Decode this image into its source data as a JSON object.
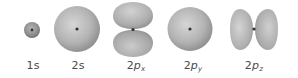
{
  "figure": {
    "title": "",
    "orbitals": [
      {
        "id": "1s",
        "label_prefix": "1",
        "label_symbol": "s",
        "label_subscript": "",
        "shape": "sphere",
        "center_x": 32,
        "center_y": 30
      },
      {
        "id": "2s",
        "label_prefix": "2",
        "label_symbol": "s",
        "label_subscript": "",
        "shape": "sphere",
        "center_x": 77,
        "center_y": 29
      },
      {
        "id": "2px",
        "label_prefix": "2",
        "label_symbol": "p",
        "label_subscript": "x",
        "shape": "dumbbell-vertical",
        "center_x": 133,
        "center_y": 29
      },
      {
        "id": "2py",
        "label_prefix": "2",
        "label_symbol": "p",
        "label_subscript": "y",
        "shape": "dumbbell-end-on",
        "center_x": 190,
        "center_y": 29
      },
      {
        "id": "2pz",
        "label_prefix": "2",
        "label_symbol": "p",
        "label_subscript": "z",
        "shape": "dumbbell-horizontal",
        "center_x": 254,
        "center_y": 29
      }
    ],
    "colors": {
      "lobe_light": "#cfcfcf",
      "lobe_mid": "#aeaeae",
      "lobe_dark": "#8c8c8c",
      "nucleus": "#3a3a3a",
      "label": "#4a4a4a",
      "background": "#ffffff"
    }
  }
}
